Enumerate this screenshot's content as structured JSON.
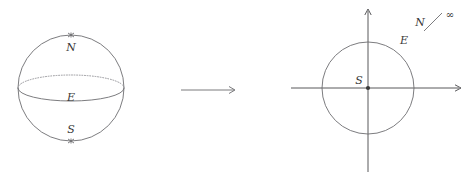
{
  "figure": {
    "width": 471,
    "height": 184,
    "background_color": "#ffffff",
    "ink_color": "#6d6d70",
    "label_color": "#3a3a3a"
  },
  "sphere": {
    "name": "riemann-sphere",
    "center": {
      "x": 71,
      "y": 88
    },
    "radius": 53,
    "equator": {
      "label": "E",
      "rx": 53,
      "ry": 13,
      "front_style": "solid",
      "back_style": "dotted"
    },
    "poles": [
      {
        "id": "north",
        "label": "N",
        "marker": "asterisk",
        "x": 71,
        "y": 35
      },
      {
        "id": "south",
        "label": "S",
        "marker": "asterisk",
        "x": 71,
        "y": 141
      }
    ],
    "labels": {
      "north": "N",
      "equator": "E",
      "south": "S"
    }
  },
  "map_arrow": {
    "name": "projection-arrow",
    "label": "",
    "x1": 181,
    "x2": 235,
    "y": 90,
    "head": "open-arrow"
  },
  "plane": {
    "name": "complex-plane",
    "origin": {
      "x": 368,
      "y": 88
    },
    "x_axis": {
      "from": 291,
      "to": 461,
      "arrow": "right"
    },
    "y_axis": {
      "from": 172,
      "to": 9,
      "arrow": "up"
    },
    "circle": {
      "label": "E",
      "radius": 46,
      "style": "solid"
    },
    "origin_point": {
      "label": "S",
      "marker": "dot"
    },
    "infinity_note": {
      "from_label": "N",
      "connector": "diagonal-line",
      "to_label": "∞"
    },
    "labels": {
      "south_at_origin": "S",
      "equator_circle": "E",
      "north": "N",
      "infinity": "∞"
    }
  }
}
